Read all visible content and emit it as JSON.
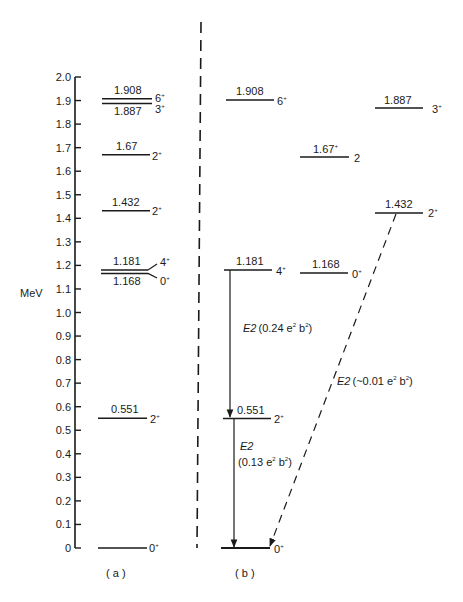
{
  "chart_data": {
    "type": "level-scheme",
    "ylabel": "MeV",
    "ylim": [
      0,
      2.0
    ],
    "yticks": [
      "0",
      "0.1",
      "0.2",
      "0.3",
      "0.4",
      "0.5",
      "0.6",
      "0.7",
      "0.8",
      "0.9",
      "1.0",
      "1.1",
      "1.2",
      "1.3",
      "1.4",
      "1.5",
      "1.6",
      "1.7",
      "1.8",
      "1.9",
      "2.0"
    ],
    "panels": [
      {
        "label": "( a )",
        "levels": [
          {
            "energy": "1.908",
            "spin": "6",
            "parity": "+"
          },
          {
            "energy": "1.887",
            "spin": "3",
            "parity": "+"
          },
          {
            "energy": "1.67",
            "spin": "2",
            "parity": "+"
          },
          {
            "energy": "1.432",
            "spin": "2",
            "parity": "+"
          },
          {
            "energy": "1.181",
            "spin": "4",
            "parity": "+"
          },
          {
            "energy": "1.168",
            "spin": "0",
            "parity": "+"
          },
          {
            "energy": "0.551",
            "spin": "2",
            "parity": "+"
          },
          {
            "energy": "",
            "spin": "0",
            "parity": "+"
          }
        ]
      },
      {
        "label": "( b )",
        "levels": [
          {
            "energy": "1.908",
            "spin": "6",
            "parity": "+"
          },
          {
            "energy": "1.887",
            "spin": "3",
            "parity": "+"
          },
          {
            "energy": "1.67",
            "spin": "2",
            "parity": "+"
          },
          {
            "energy": "1.432",
            "spin": "2",
            "parity": "+"
          },
          {
            "energy": "1.181",
            "spin": "4",
            "parity": "+"
          },
          {
            "energy": "1.168",
            "spin": "0",
            "parity": "+"
          },
          {
            "energy": "0.551",
            "spin": "2",
            "parity": "+"
          },
          {
            "energy": "",
            "spin": "0",
            "parity": "+"
          }
        ],
        "transitions": [
          {
            "from": "1.181",
            "to": "0.551",
            "type": "E2",
            "strength": "0.24 e²b²",
            "style": "solid"
          },
          {
            "from": "0.551",
            "to": "0",
            "type": "E2",
            "strength": "0.13 e²b²",
            "style": "solid"
          },
          {
            "from": "1.432",
            "to": "0",
            "type": "E2",
            "strength": "~0.01 e²b²",
            "style": "dashed"
          }
        ]
      }
    ]
  },
  "axis": {
    "unit": "MeV",
    "ticks": [
      "0",
      "0.1",
      "0.2",
      "0.3",
      "0.4",
      "0.5",
      "0.6",
      "0.7",
      "0.8",
      "0.9",
      "1.0",
      "1.1",
      "1.2",
      "1.3",
      "1.4",
      "1.5",
      "1.6",
      "1.7",
      "1.8",
      "1.9",
      "2.0"
    ]
  },
  "panel_a": {
    "caption": "( a )",
    "l1908": "1.908",
    "s1908": "6",
    "l1887": "1.887",
    "s1887": "3",
    "l167": "1.67",
    "s167": "2",
    "l1432": "1.432",
    "s1432": "2",
    "l1181": "1.181",
    "s1181": "4",
    "l1168": "1.168",
    "s1168": "0",
    "l0551": "0.551",
    "s0551": "2",
    "s0": "0",
    "parity": "+"
  },
  "panel_b": {
    "caption": "( b )",
    "l1908": "1.908",
    "s1908": "6",
    "l1887": "1.887",
    "s1887": "3",
    "l167": "1.67",
    "s167": "2",
    "l1432": "1.432",
    "s1432": "2",
    "l1181": "1.181",
    "s1181": "4",
    "l1168": "1.168",
    "s1168": "0",
    "l0551": "0.551",
    "s0551": "2",
    "s0": "0",
    "parity": "+",
    "t1_type": "E2",
    "t1_strength": "(0.24 e",
    "t1_mid": " b",
    "t1_end": ")",
    "t2_type": "E2",
    "t2_strength": "(0.13 e",
    "t2_mid": " b",
    "t2_end": ")",
    "t3_type": "E2",
    "t3_strength": "(~0.01 e",
    "t3_mid": " b",
    "t3_end": ")",
    "exp": "2"
  }
}
